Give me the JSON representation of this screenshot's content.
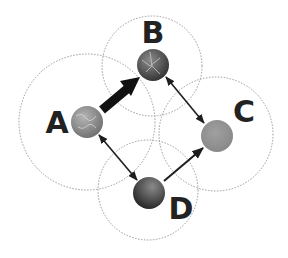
{
  "diagram": {
    "type": "network",
    "nodes": [
      {
        "id": "A",
        "label": "A",
        "cx": 87,
        "cy": 122,
        "r": 16,
        "fill": "#8a8a8a",
        "range_r": 68,
        "range_cx": 87,
        "range_cy": 122,
        "label_x": 57,
        "label_y": 133
      },
      {
        "id": "B",
        "label": "B",
        "cx": 153,
        "cy": 65,
        "r": 16,
        "fill": "#5a5a5a",
        "range_r": 50,
        "range_cx": 152,
        "range_cy": 66,
        "label_x": 153,
        "label_y": 43
      },
      {
        "id": "C",
        "label": "C",
        "cx": 217,
        "cy": 136,
        "r": 16,
        "fill": "#909090",
        "range_r": 57,
        "range_cx": 216,
        "range_cy": 134,
        "label_x": 244,
        "label_y": 122
      },
      {
        "id": "D",
        "label": "D",
        "cx": 149,
        "cy": 193,
        "r": 16,
        "fill": "#444444",
        "range_r": 50,
        "range_cx": 148,
        "range_cy": 190,
        "label_x": 181,
        "label_y": 219
      }
    ],
    "edges": [
      {
        "from": "A",
        "to": "B",
        "style": "thick",
        "direction": "forward"
      },
      {
        "from": "B",
        "to": "C",
        "style": "thin",
        "direction": "both"
      },
      {
        "from": "A",
        "to": "D",
        "style": "thin",
        "direction": "both"
      },
      {
        "from": "D",
        "to": "C",
        "style": "thin",
        "direction": "forward"
      }
    ],
    "colors": {
      "range_circle": "#9a9a9a",
      "edge": "#1e1e1e",
      "label": "#222222"
    }
  }
}
